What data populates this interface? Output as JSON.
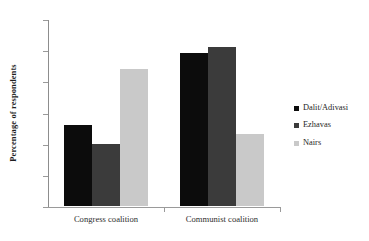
{
  "chart_data": {
    "type": "bar",
    "title": "",
    "subtitle": "",
    "xlabel": "",
    "ylabel": "Percentage of respondents",
    "categories": [
      "Congress coalition",
      "Communist coalition"
    ],
    "series": [
      {
        "name": "Dalit/Adivasi",
        "values": [
          26,
          49
        ],
        "color": "#0c0c0c"
      },
      {
        "name": "Ezhavas",
        "values": [
          20,
          51
        ],
        "color": "#3b3b3b"
      },
      {
        "name": "Nairs",
        "values": [
          44,
          23
        ],
        "color": "#c9c9c9"
      }
    ],
    "ylim": [
      0,
      60
    ],
    "yticks": [
      0,
      10,
      20,
      30,
      40,
      50,
      60
    ],
    "ytick_labels": [
      "0",
      "10",
      "20",
      "30",
      "40",
      "50",
      "60"
    ],
    "grid": false,
    "legend_position": "right",
    "annotations": []
  },
  "axes": {
    "y_title": "Percentage of respondents",
    "tick_0": "0",
    "tick_10": "10",
    "tick_20": "20",
    "tick_30": "30",
    "tick_40": "40",
    "tick_50": "50",
    "tick_60": "60"
  },
  "categories": {
    "cat_0": "Congress coalition",
    "cat_1": "Communist coalition"
  },
  "legend": {
    "item_0": "Dalit/Adivasi",
    "item_1": "Ezhavas",
    "item_2": "Nairs"
  }
}
